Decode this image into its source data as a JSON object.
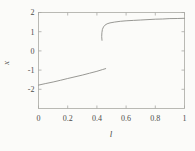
{
  "figure": {
    "background": "#fbfbf9",
    "frame_color": "#a8a8a4",
    "curve_color": "#8c8c88",
    "text_color": "#4d4d4a",
    "tick_length": 3
  },
  "chart_data": {
    "type": "line",
    "title": "",
    "xlabel": "l",
    "ylabel": "x",
    "xlim": [
      0,
      1
    ],
    "ylim": [
      -3,
      2
    ],
    "grid": false,
    "frame": "box-with-mirrored-inward-ticks",
    "legend": "none",
    "xticks": {
      "values": [
        0,
        0.2,
        0.4,
        0.6,
        0.8,
        1
      ],
      "labels": [
        "0",
        "0.2",
        "0.4",
        "0.6",
        "0.8",
        "1"
      ]
    },
    "yticks": {
      "values": [
        -2,
        -1,
        0,
        1,
        2
      ],
      "labels": [
        "-2",
        "-1",
        "0",
        "1",
        "2"
      ]
    },
    "series": [
      {
        "name": "lower-branch",
        "points": [
          [
            0.0,
            -1.78
          ],
          [
            0.05,
            -1.7
          ],
          [
            0.1,
            -1.62
          ],
          [
            0.15,
            -1.53
          ],
          [
            0.2,
            -1.44
          ],
          [
            0.25,
            -1.35
          ],
          [
            0.3,
            -1.26
          ],
          [
            0.35,
            -1.16
          ],
          [
            0.4,
            -1.06
          ],
          [
            0.44,
            -0.97
          ],
          [
            0.46,
            -0.92
          ]
        ]
      },
      {
        "name": "upper-branch",
        "points": [
          [
            0.435,
            0.55
          ],
          [
            0.433,
            0.75
          ],
          [
            0.434,
            0.95
          ],
          [
            0.438,
            1.12
          ],
          [
            0.445,
            1.25
          ],
          [
            0.455,
            1.34
          ],
          [
            0.47,
            1.41
          ],
          [
            0.49,
            1.46
          ],
          [
            0.52,
            1.5
          ],
          [
            0.56,
            1.54
          ],
          [
            0.6,
            1.57
          ],
          [
            0.65,
            1.59
          ],
          [
            0.7,
            1.61
          ],
          [
            0.75,
            1.63
          ],
          [
            0.8,
            1.65
          ],
          [
            0.85,
            1.66
          ],
          [
            0.9,
            1.68
          ],
          [
            0.95,
            1.69
          ],
          [
            1.0,
            1.7
          ]
        ]
      }
    ]
  }
}
